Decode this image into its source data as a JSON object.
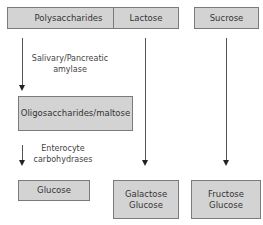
{
  "diagram": {
    "type": "flowchart",
    "nodes": {
      "polysaccharides": "Polysaccharides",
      "lactose": "Lactose",
      "sucrose": "Sucrose",
      "oligosaccharides": "Oligosaccharides/maltose",
      "glucose": "Glucose",
      "galactose_glucose": [
        "Galactose",
        "Glucose"
      ],
      "fructose_glucose": [
        "Fructose",
        "Glucose"
      ]
    },
    "edges": {
      "amylase": [
        "Salivary/Pancreatic",
        "amylase"
      ],
      "carbohydrases": [
        "Enterocyte",
        "carbohydrases"
      ]
    },
    "colors": {
      "box_fill": "#d3d3d3",
      "box_border": "#7a7a7a",
      "arrow": "#555555"
    }
  }
}
